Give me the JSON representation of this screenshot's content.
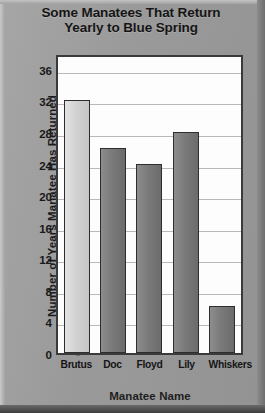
{
  "chart_data": {
    "type": "bar",
    "title": "Some Manatees That Return Yearly to Blue Spring",
    "title_line1": "Some Manatees That Return",
    "title_line2": "Yearly to Blue Spring",
    "xlabel": "Manatee Name",
    "ylabel": "Number of Years Manatee Has Returned",
    "categories": [
      "Brutus",
      "Doc",
      "Floyd",
      "Lily",
      "Whiskers"
    ],
    "values": [
      32,
      26,
      24,
      28,
      6
    ],
    "ylim": [
      0,
      38
    ],
    "yticks": [
      0,
      4,
      8,
      12,
      16,
      20,
      24,
      28,
      32,
      36
    ],
    "ytick_labels": [
      "0",
      "4",
      "8",
      "12",
      "16",
      "20",
      "24",
      "28",
      "32",
      "36"
    ],
    "grid": true,
    "legend": null,
    "bar_styles": [
      "light",
      "dark",
      "dark",
      "dark",
      "dark"
    ],
    "colors": {
      "background": "#9b9b9b",
      "plot_background": "#fdfdfd",
      "plot_border": "#3a3a3a",
      "gridline": "#b9b9b9",
      "bar_light": "#d2d2d2",
      "bar_dark": "#7c7c7c",
      "text": "#151515"
    }
  }
}
